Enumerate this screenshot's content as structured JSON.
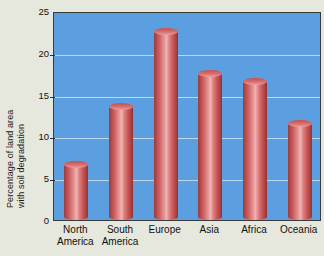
{
  "chart_data": {
    "type": "bar",
    "title": "",
    "subtitle": "",
    "xlabel": "",
    "ylabel": "Percentage of land area with soil degradation",
    "ylabel_lines": [
      "Percentage of land area",
      "with soil degradation"
    ],
    "categories": [
      "North America",
      "South America",
      "Europe",
      "Asia",
      "Africa",
      "Oceania"
    ],
    "category_lines": [
      [
        "North",
        "America"
      ],
      [
        "South",
        "America"
      ],
      [
        "Europe",
        ""
      ],
      [
        "Asia",
        ""
      ],
      [
        "Africa",
        ""
      ],
      [
        "Oceania",
        ""
      ]
    ],
    "values": [
      7,
      14,
      23,
      18,
      17,
      12
    ],
    "ylim": [
      0,
      25
    ],
    "yticks": [
      0,
      5,
      10,
      15,
      20,
      25
    ],
    "ytick_labels": [
      "0",
      "5",
      "10",
      "15",
      "20",
      "25"
    ],
    "grid": true,
    "grid_axis": "y",
    "legend": false,
    "legend_position": "none",
    "units": "percent"
  },
  "style": {
    "plot_background": "#5c9fe0",
    "figure_background": "#e6e8dd",
    "gridline_color": "#bcd9f2",
    "bar_color": "#cc5f60",
    "bar_highlight": "#efb4b2",
    "bar_shadow": "#8e3133",
    "axis_color": "#3a3a3a",
    "text_color": "#101010"
  }
}
